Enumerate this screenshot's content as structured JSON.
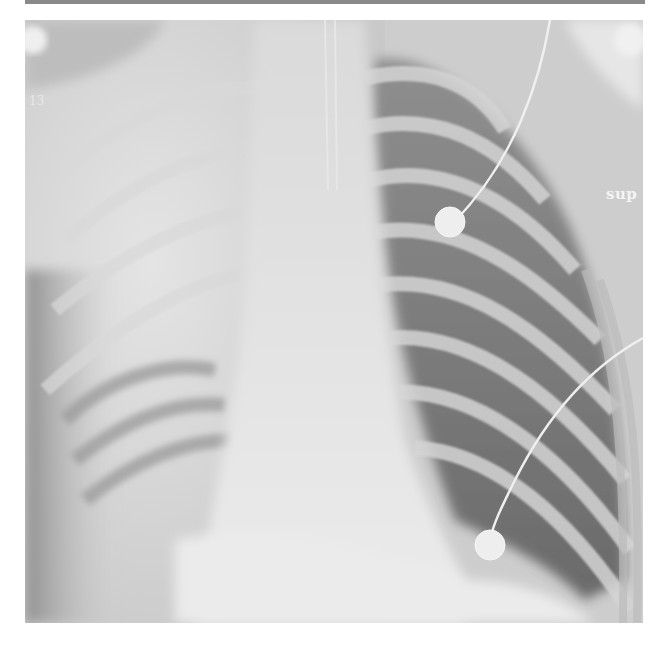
{
  "image": {
    "type": "chest radiograph (AP)",
    "annotations": {
      "side_marker": "sup",
      "corner_marker": "13"
    },
    "features": {
      "ecg_electrodes": 2,
      "lead_wires": 2
    }
  },
  "colors": {
    "background": "#ffffff",
    "top_bar": "#8a8a8a",
    "film_base": "#cfcfcf",
    "lung_dark": "#5a5a5a",
    "opacity_light": "#e6e6e6",
    "electrode": "#eeeeee"
  }
}
